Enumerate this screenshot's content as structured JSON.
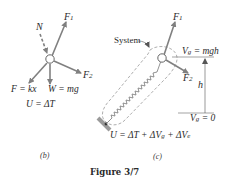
{
  "figure": {
    "caption": "Figure 3/7",
    "colors": {
      "arrow": "#808080",
      "line": "#555555",
      "text": "#2a2a2a",
      "dashed": "#888888",
      "ground": "#909090"
    }
  },
  "panel_b": {
    "label": "(b)",
    "forces": {
      "N": "N",
      "F1": "F",
      "F1_sub": "1",
      "F2": "F",
      "F2_sub": "2",
      "spring": "F = kx",
      "weight": "W = mg"
    },
    "equation": "U = ΔT"
  },
  "panel_c": {
    "label": "(c)",
    "system_label": "System",
    "forces": {
      "F1": "F",
      "F1_sub": "1",
      "F2": "F",
      "F2_sub": "2"
    },
    "potential_top": "V",
    "potential_top_sub": "g",
    "potential_top_rhs": " = mgh",
    "potential_bottom": "V",
    "potential_bottom_sub": "g",
    "potential_bottom_rhs": " = 0",
    "height_label": "h",
    "equation_parts": {
      "a": "U = ΔT + ΔV",
      "a_sub": "g",
      "b": " + ΔV",
      "b_sub": "e"
    }
  }
}
